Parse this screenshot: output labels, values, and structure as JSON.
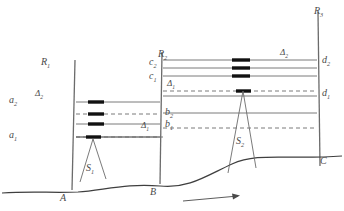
{
  "diagram": {
    "type": "engineering-section-diagram",
    "colors": {
      "line": "#6b6b6b",
      "terrain": "#3f3f3f",
      "marker": "#111111",
      "text": "#4a4a4a",
      "background": "#ffffff"
    },
    "reference_lines": [
      {
        "id": "R1",
        "label": "R",
        "sub": "1",
        "x": 75,
        "y_top": 60,
        "y_bottom": 186
      },
      {
        "id": "R2",
        "label": "R",
        "sub": "2",
        "x": 162,
        "y_top": 52,
        "y_bottom": 178
      },
      {
        "id": "R3",
        "label": "R",
        "sub": "3",
        "x": 318,
        "y_top": 12,
        "y_bottom": 168
      }
    ],
    "ground_points": [
      {
        "id": "A",
        "label": "A",
        "x": 70,
        "y": 192
      },
      {
        "id": "B",
        "label": "B",
        "x": 160,
        "y": 186
      },
      {
        "id": "C",
        "label": "C",
        "x": 320,
        "y": 166
      }
    ],
    "level_labels": [
      {
        "id": "a2",
        "label": "a",
        "sub": "2",
        "x": 11,
        "y": 97
      },
      {
        "id": "a1",
        "label": "a",
        "sub": "1",
        "x": 11,
        "y": 132
      },
      {
        "id": "b2",
        "label": "b",
        "sub": "2",
        "x": 166,
        "y": 113
      },
      {
        "id": "b1",
        "label": "b",
        "sub": "1",
        "x": 166,
        "y": 124
      },
      {
        "id": "c2",
        "label": "c",
        "sub": "2",
        "x": 151,
        "y": 64
      },
      {
        "id": "c1",
        "label": "c",
        "sub": "1",
        "x": 151,
        "y": 78
      },
      {
        "id": "d2",
        "label": "d",
        "sub": "2",
        "x": 322,
        "y": 62
      },
      {
        "id": "d1",
        "label": "d",
        "sub": "1",
        "x": 322,
        "y": 94
      }
    ],
    "delta_labels": [
      {
        "id": "delta2-left",
        "label": "Δ",
        "sub": "2",
        "x": 36,
        "y": 92
      },
      {
        "id": "delta1-left",
        "label": "Δ",
        "sub": "1",
        "x": 142,
        "y": 124
      },
      {
        "id": "delta1-mid",
        "label": "Δ",
        "sub": "1",
        "x": 169,
        "y": 85
      },
      {
        "id": "delta2-right",
        "label": "Δ",
        "sub": "2",
        "x": 281,
        "y": 55
      }
    ],
    "structures": [
      {
        "id": "S1",
        "label": "S",
        "sub": "1",
        "x": 88,
        "y": 168,
        "apex_x": 93,
        "apex_y": 139
      },
      {
        "id": "S2",
        "label": "S",
        "sub": "2",
        "x": 239,
        "y": 143,
        "apex_x": 243,
        "apex_y": 91
      }
    ],
    "arrow": {
      "id": "direction-arrow",
      "x1": 183,
      "y1": 201,
      "x2": 240,
      "y2": 195
    }
  }
}
